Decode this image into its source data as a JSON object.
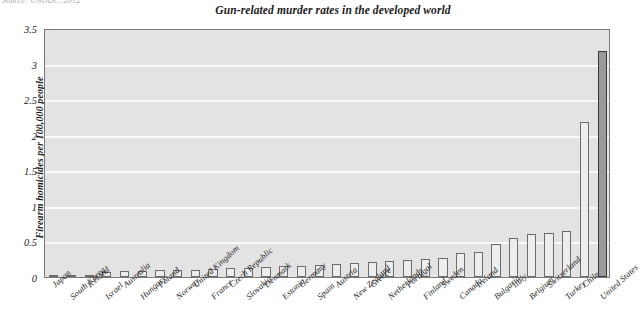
{
  "source_note": "Source: UNODC, 2012",
  "chart_data": {
    "type": "bar",
    "title": "Gun-related murder rates in the developed world",
    "xlabel": "",
    "ylabel": "Firearm homicides per 100,000 people",
    "ylim": [
      0,
      3.5
    ],
    "ytick_labels": [
      "0",
      "0.5",
      "1",
      "1.5",
      "2",
      "2.5",
      "3",
      "3.5"
    ],
    "ytick_values": [
      0,
      0.5,
      1,
      1.5,
      2,
      2.5,
      3,
      3.5
    ],
    "grid": true,
    "legend": "none",
    "highlight_category": "United States",
    "categories": [
      "Japan",
      "South Korea",
      "Iceland",
      "Israel",
      "Australia",
      "Hungary",
      "Poland",
      "Norway",
      "United Kingdom",
      "France",
      "Czech Republic",
      "Slovakia",
      "Denmark",
      "Estonia",
      "Germany",
      "Spain",
      "Austria",
      "New Zealand",
      "Greece",
      "Netherlands",
      "Portugal",
      "Finland",
      "Sweden",
      "Canada",
      "Ireland",
      "Bulgaria",
      "Italy",
      "Belgium",
      "Switzerland",
      "Turkey",
      "Chile",
      "United States"
    ],
    "values": [
      0.01,
      0.02,
      0.03,
      0.07,
      0.09,
      0.09,
      0.1,
      0.1,
      0.1,
      0.11,
      0.12,
      0.13,
      0.14,
      0.15,
      0.16,
      0.17,
      0.18,
      0.19,
      0.21,
      0.22,
      0.24,
      0.26,
      0.27,
      0.34,
      0.35,
      0.46,
      0.55,
      0.6,
      0.62,
      0.64,
      2.18,
      3.17
    ]
  }
}
